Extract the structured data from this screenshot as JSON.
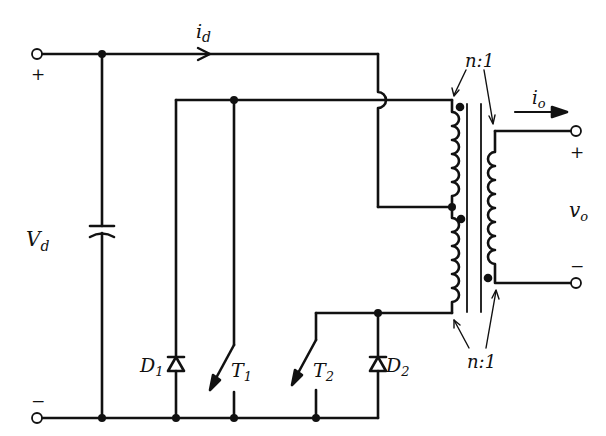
{
  "diagram": {
    "type": "push-pull converter circuit schematic",
    "stroke_color": "#111111",
    "background": "#ffffff",
    "labels": {
      "input_current": "i",
      "input_current_sub": "d",
      "input_voltage": "V",
      "input_voltage_sub": "d",
      "input_plus": "+",
      "input_minus": "−",
      "output_current": "i",
      "output_current_sub": "o",
      "output_voltage": "v",
      "output_voltage_sub": "o",
      "output_plus": "+",
      "output_minus": "−",
      "turns_ratio_top": "n:1",
      "turns_ratio_bottom": "n:1",
      "diode1": "D",
      "diode1_sub": "1",
      "diode2": "D",
      "diode2_sub": "2",
      "switch1": "T",
      "switch1_sub": "1",
      "switch2": "T",
      "switch2_sub": "2"
    },
    "components": [
      {
        "id": "Vd",
        "kind": "dc-input-capacitor"
      },
      {
        "id": "D1",
        "kind": "diode"
      },
      {
        "id": "T1",
        "kind": "switch"
      },
      {
        "id": "T2",
        "kind": "switch"
      },
      {
        "id": "D2",
        "kind": "diode"
      },
      {
        "id": "XFMR",
        "kind": "center-tapped transformer",
        "ratio": "n:1"
      }
    ]
  }
}
